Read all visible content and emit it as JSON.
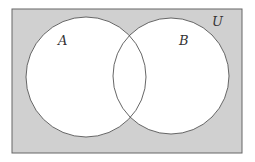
{
  "diagram": {
    "type": "venn",
    "universe_label": "U",
    "sets": [
      {
        "label": "A"
      },
      {
        "label": "B"
      }
    ],
    "colors": {
      "universe_fill": "#d0d0d0",
      "set_fill": "#ffffff",
      "stroke": "#555555"
    }
  }
}
